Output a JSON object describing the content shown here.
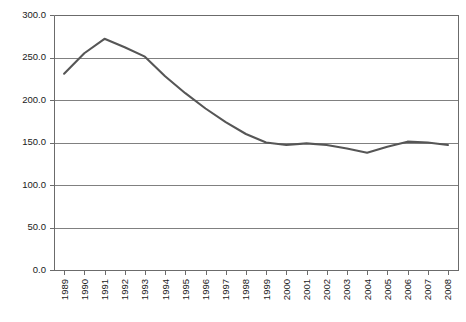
{
  "chart_data": {
    "type": "line",
    "title": "",
    "subtitle": "",
    "xlabel": "",
    "ylabel": "",
    "categories": [
      "1989",
      "1990",
      "1991",
      "1992",
      "1993",
      "1994",
      "1995",
      "1996",
      "1997",
      "1998",
      "1999",
      "2000",
      "2001",
      "2002",
      "2003",
      "2004",
      "2005",
      "2006",
      "2007",
      "2008"
    ],
    "series": [
      {
        "name": "series-1",
        "color": "#565656",
        "values": [
          231.0,
          255.0,
          272.0,
          262.0,
          251.0,
          228.0,
          208.0,
          190.0,
          174.0,
          160.0,
          150.0,
          147.0,
          149.0,
          147.0,
          143.0,
          138.0,
          145.0,
          151.0,
          150.0,
          147.0
        ]
      }
    ],
    "ylim": [
      0.0,
      300.0
    ],
    "ytick_values": [
      0.0,
      50.0,
      100.0,
      150.0,
      200.0,
      250.0,
      300.0
    ],
    "ytick_labels": [
      "0.0",
      "50.0",
      "100.0",
      "150.0",
      "200.0",
      "250.0",
      "300.0"
    ],
    "grid": true,
    "grid_axis": "y",
    "legend": false,
    "legend_position": "none",
    "xtick_label_rotation": -90,
    "plot_area": {
      "left": 54,
      "top": 15,
      "right": 458,
      "bottom": 270
    },
    "colors": {
      "line": "#565656",
      "grid": "#808080",
      "axis": "#6b6b6b",
      "text": "#1a1a1a",
      "background": "#ffffff"
    }
  }
}
